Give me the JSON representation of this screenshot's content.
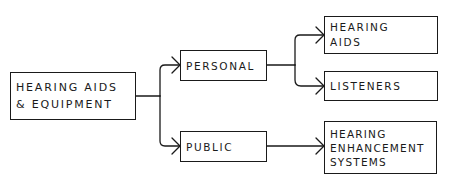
{
  "diagram": {
    "type": "hierarchy",
    "style": "hand-drawn flowchart",
    "nodes": {
      "root": {
        "lines": [
          "Hearing Aids",
          "& Equipment"
        ]
      },
      "personal": {
        "lines": [
          "Personal"
        ]
      },
      "public": {
        "lines": [
          "Public"
        ]
      },
      "hearing_aids": {
        "lines": [
          "Hearing",
          "Aids"
        ]
      },
      "listeners": {
        "lines": [
          "Listeners"
        ]
      },
      "hearing_enhancement_systems": {
        "lines": [
          "Hearing",
          "Enhancement",
          "Systems"
        ]
      }
    },
    "edges": [
      {
        "from": "Hearing Aids & Equipment",
        "to": "Personal"
      },
      {
        "from": "Hearing Aids & Equipment",
        "to": "Public"
      },
      {
        "from": "Personal",
        "to": "Hearing Aids"
      },
      {
        "from": "Personal",
        "to": "Listeners"
      },
      {
        "from": "Public",
        "to": "Hearing Enhancement Systems"
      }
    ],
    "colors": {
      "line": "#1a1a1a",
      "background": "#ffffff"
    }
  }
}
